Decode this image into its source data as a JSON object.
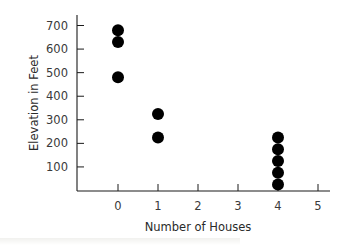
{
  "chart_data": {
    "type": "scatter",
    "title": "",
    "xlabel": "Number of Houses",
    "ylabel": "Elevation in Feet",
    "x_ticks": [
      0,
      1,
      2,
      3,
      4,
      5
    ],
    "y_ticks": [
      100,
      200,
      300,
      400,
      500,
      600,
      700
    ],
    "xlim": [
      -1,
      5
    ],
    "ylim": [
      0,
      750
    ],
    "grid": false,
    "legend": null,
    "series": [
      {
        "name": "Elevations",
        "color": "#000000",
        "points": [
          {
            "x": 0,
            "y": 680
          },
          {
            "x": 0,
            "y": 630
          },
          {
            "x": 0,
            "y": 480
          },
          {
            "x": 1,
            "y": 325
          },
          {
            "x": 1,
            "y": 225
          },
          {
            "x": 4,
            "y": 225
          },
          {
            "x": 4,
            "y": 175
          },
          {
            "x": 4,
            "y": 125
          },
          {
            "x": 4,
            "y": 75
          },
          {
            "x": 4,
            "y": 25
          }
        ]
      }
    ]
  },
  "colors": {
    "axis": "#1a1a1a",
    "marker": "#000000",
    "text": "#3a3a3a"
  }
}
